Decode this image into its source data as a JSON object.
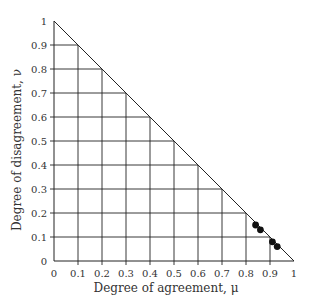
{
  "chart_data": {
    "type": "scatter",
    "title": "",
    "xlabel": "Degree of agreement, μ",
    "ylabel": "Degree of disagreement, ν",
    "xlim": [
      0,
      1
    ],
    "ylim": [
      0,
      1
    ],
    "xticks": [
      "0",
      "0.1",
      "0.2",
      "0.3",
      "0.4",
      "0.5",
      "0.6",
      "0.7",
      "0.8",
      "0.9",
      "1"
    ],
    "yticks": [
      "0",
      "0.1",
      "0.2",
      "0.3",
      "0.4",
      "0.5",
      "0.6",
      "0.7",
      "0.8",
      "0.9",
      "1"
    ],
    "grid": "triangular grid below line μ + ν = 1 at 0.1 spacing",
    "boundary": {
      "type": "line",
      "from": [
        0,
        1
      ],
      "to": [
        1,
        0
      ],
      "label": "μ + ν = 1"
    },
    "series": [
      {
        "name": "points",
        "marker": "filled-circle",
        "color": "#111111",
        "points": [
          {
            "x": 0.84,
            "y": 0.15
          },
          {
            "x": 0.86,
            "y": 0.13
          },
          {
            "x": 0.91,
            "y": 0.08
          },
          {
            "x": 0.93,
            "y": 0.06
          }
        ]
      }
    ]
  },
  "style": {
    "line_color": "#222222",
    "text_color": "#333333",
    "marker_color": "#111111"
  }
}
